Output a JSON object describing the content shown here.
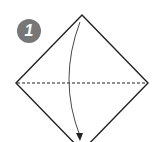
{
  "diagram": {
    "type": "origami-step",
    "step": {
      "number": "1",
      "badge_color": "#777777"
    },
    "paper": {
      "shape": "diamond",
      "stroke": "#222222",
      "fill": "#ffffff"
    },
    "fold_line": {
      "style": "dashed",
      "orientation": "horizontal",
      "kind": "valley-fold"
    },
    "arrow": {
      "direction": "top-to-bottom",
      "meaning": "fold top corner down to bottom corner"
    }
  }
}
